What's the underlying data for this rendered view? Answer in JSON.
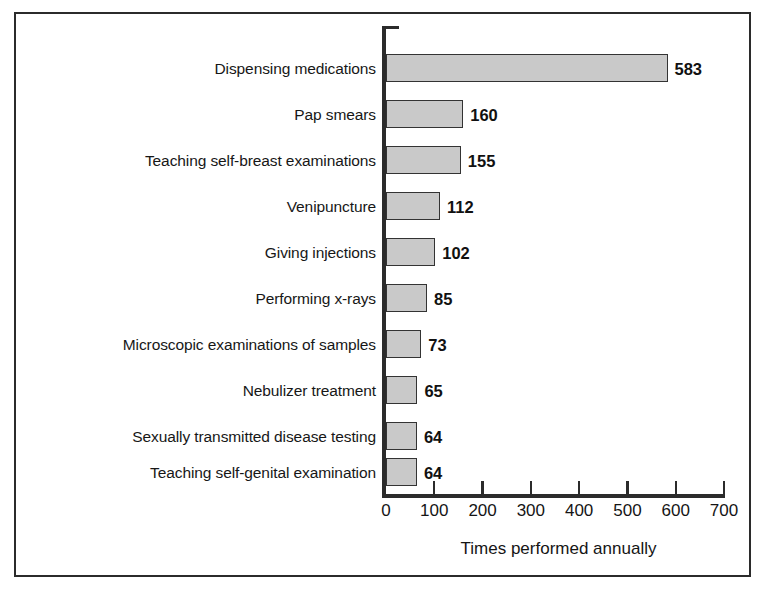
{
  "chart_data": {
    "type": "bar",
    "orientation": "horizontal",
    "title": "",
    "xlabel": "Times performed annually",
    "ylabel": "",
    "xlim": [
      0,
      700
    ],
    "xticks": [
      0,
      100,
      200,
      300,
      400,
      500,
      600,
      700
    ],
    "xtick_labels": [
      "0",
      "100",
      "200",
      "300",
      "400",
      "500",
      "600",
      "700"
    ],
    "grid": false,
    "legend": null,
    "categories": [
      "Dispensing medications",
      "Pap smears",
      "Teaching self-breast examinations",
      "Venipuncture",
      "Giving injections",
      "Performing x-rays",
      "Microscopic examinations of samples",
      "Nebulizer treatment",
      "Sexually transmitted disease testing",
      "Teaching self-genital examination"
    ],
    "values": [
      583,
      160,
      155,
      112,
      102,
      85,
      73,
      65,
      64,
      64
    ],
    "value_labels": [
      "583",
      "160",
      "155",
      "112",
      "102",
      "85",
      "73",
      "65",
      "64",
      "64"
    ],
    "colors": {
      "bar_fill": "#c9c9c9",
      "bar_border": "#333333",
      "axis": "#2b2b2b",
      "text": "#151515",
      "background": "#ffffff",
      "frame": "#2b2b2b"
    }
  }
}
